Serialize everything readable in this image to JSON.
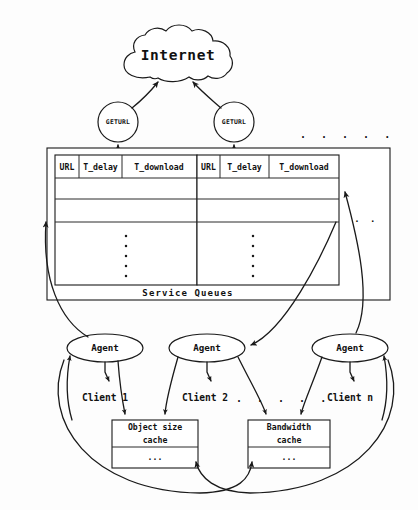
{
  "diagram": {
    "colors": {
      "ink": "#1a1a1a",
      "paper": "#fdfdfd",
      "box_fill": "#ffffff"
    },
    "cloud": {
      "label": "Internet"
    },
    "fetchers": [
      {
        "label": "GETURL"
      },
      {
        "label": "GETURL"
      }
    ],
    "fetchers_more": ". . . . .",
    "service_queues": {
      "caption": "Service Queues",
      "columns": [
        "URL",
        "T_delay",
        "T_download"
      ],
      "queues": [
        {
          "columns": [
            "URL",
            "T_delay",
            "T_download"
          ],
          "rows": [
            "",
            ""
          ],
          "continuation": "vertical-dots"
        },
        {
          "columns": [
            "URL",
            "T_delay",
            "T_download"
          ],
          "rows": [
            "",
            ""
          ],
          "continuation": "vertical-dots"
        }
      ],
      "more_queues": ". ."
    },
    "agents": [
      {
        "label": "Agent",
        "client": "Client 1"
      },
      {
        "label": "Agent",
        "client": "Client 2"
      },
      {
        "label": "Agent",
        "client": "Client n"
      }
    ],
    "clients_more": ". . . . .",
    "caches": [
      {
        "line1": "Object size",
        "line2": "cache",
        "rows": [
          "..."
        ]
      },
      {
        "line1": "Bandwidth",
        "line2": "cache",
        "rows": [
          "..."
        ]
      }
    ]
  }
}
